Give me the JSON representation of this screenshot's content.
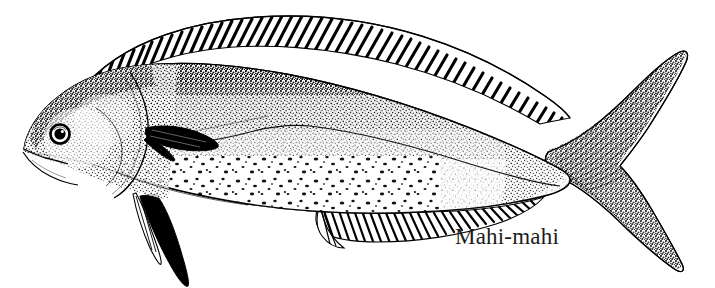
{
  "figure": {
    "title": "Mahi-mahi",
    "style": "stippled pen-and-ink scientific illustration",
    "orientation": "left-facing lateral view",
    "background_color": "#ffffff",
    "ink_color": "#000000",
    "canvas": {
      "width": 715,
      "height": 288
    }
  },
  "label": {
    "text": "Mahi-mahi",
    "color": "#1c1c1c",
    "x": 455,
    "y": 225,
    "font_size_px": 23
  },
  "anatomy": {
    "parts": [
      {
        "name": "head",
        "description": "blunt steep forehead of a bull mahi-mahi"
      },
      {
        "name": "eye",
        "description": "round eye with dark ring, light iris and dark pupil"
      },
      {
        "name": "mouth",
        "description": "terminal mouth with lower jaw line"
      },
      {
        "name": "operculum",
        "description": "curved gill cover outline behind head"
      },
      {
        "name": "dorsal-fin",
        "description": "long fin from nape to caudal peduncle with diagonal ray striations"
      },
      {
        "name": "pectoral-fin",
        "description": "small dark fin just behind gill cover"
      },
      {
        "name": "pelvic-fin",
        "description": "long narrow dark blade trailing below belly"
      },
      {
        "name": "anal-fin",
        "description": "striated fin along lower rear body"
      },
      {
        "name": "caudal-fin",
        "description": "deeply forked lunate tail with radiating ray lines"
      },
      {
        "name": "lateral-line",
        "description": "faint line running mid-body from gill to tail"
      },
      {
        "name": "belly-speckles",
        "description": "coarse dark spots scattered over pale lower flank"
      }
    ]
  }
}
